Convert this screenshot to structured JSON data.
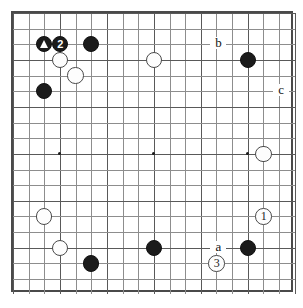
{
  "diagram": {
    "kind": "go-board-diagram",
    "board_size": 19,
    "visible_columns": 18,
    "visible_rows": 18,
    "colors": {
      "black_stone": "#1b1b1b",
      "white_stone": "#fdfdfd",
      "grid_line": "#8d8d8d",
      "grid_line_major": "#595959",
      "border": "#4a4a4a",
      "background": "#ffffff",
      "label_text": "#111111"
    },
    "grid": {
      "origin_x": 11,
      "origin_y": 11,
      "spacing": 15.65,
      "line_count_x": 18,
      "line_count_y": 18
    },
    "hoshi_points": [
      {
        "col": 3,
        "row": 9
      },
      {
        "col": 9,
        "row": 9
      },
      {
        "col": 15,
        "row": 9
      }
    ],
    "stones": [
      {
        "id": "marked-black-triangle",
        "color": "black",
        "col": 2,
        "row": 2,
        "mark": "triangle",
        "label": ""
      },
      {
        "id": "black-move-2",
        "color": "black",
        "col": 3,
        "row": 2,
        "mark": "number",
        "label": "2"
      },
      {
        "id": "black-top-left-d",
        "color": "black",
        "col": 5,
        "row": 2,
        "mark": "none",
        "label": ""
      },
      {
        "id": "white-under-triangle",
        "color": "white",
        "col": 3,
        "row": 3,
        "mark": "none",
        "label": ""
      },
      {
        "id": "white-diag",
        "color": "white",
        "col": 4,
        "row": 4,
        "mark": "none",
        "label": ""
      },
      {
        "id": "black-left-side",
        "color": "black",
        "col": 2,
        "row": 5,
        "mark": "none",
        "label": ""
      },
      {
        "id": "white-top-center",
        "color": "white",
        "col": 9,
        "row": 3,
        "mark": "none",
        "label": ""
      },
      {
        "id": "black-top-right",
        "color": "black",
        "col": 15,
        "row": 3,
        "mark": "none",
        "label": ""
      },
      {
        "id": "white-right-hoshi",
        "color": "white",
        "col": 16,
        "row": 9,
        "mark": "none",
        "label": ""
      },
      {
        "id": "white-move-1",
        "color": "white",
        "col": 16,
        "row": 13,
        "mark": "number",
        "label": "1"
      },
      {
        "id": "white-lower-left",
        "color": "white",
        "col": 2,
        "row": 13,
        "mark": "none",
        "label": ""
      },
      {
        "id": "white-lower-left-2",
        "color": "white",
        "col": 3,
        "row": 15,
        "mark": "none",
        "label": ""
      },
      {
        "id": "black-bottom-left",
        "color": "black",
        "col": 5,
        "row": 16,
        "mark": "none",
        "label": ""
      },
      {
        "id": "black-bottom-center",
        "color": "black",
        "col": 9,
        "row": 15,
        "mark": "none",
        "label": ""
      },
      {
        "id": "black-bottom-right",
        "color": "black",
        "col": 15,
        "row": 15,
        "mark": "none",
        "label": ""
      },
      {
        "id": "white-move-3",
        "color": "white",
        "col": 13,
        "row": 16,
        "mark": "number",
        "label": "3"
      }
    ],
    "point_labels": [
      {
        "id": "label-b",
        "text": "b",
        "col": 13,
        "row": 2
      },
      {
        "id": "label-c",
        "text": "c",
        "col": 17,
        "row": 5
      },
      {
        "id": "label-a",
        "text": "a",
        "col": 13,
        "row": 15
      }
    ]
  }
}
